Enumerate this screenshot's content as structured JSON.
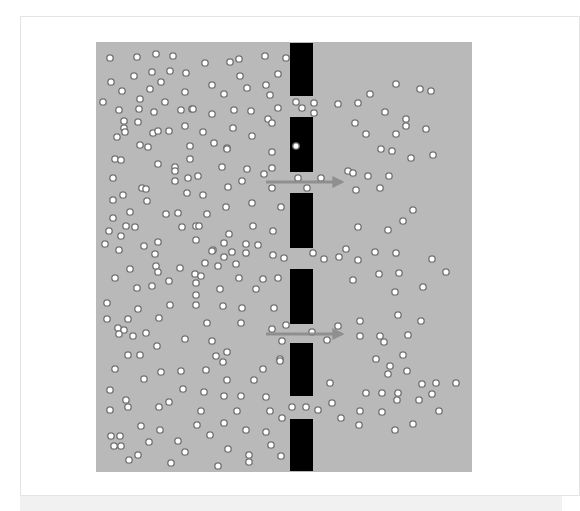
{
  "figure": {
    "colors": {
      "background": "#b9b9b9",
      "membrane": "#000000",
      "particle_fill": "#ffffff",
      "particle_stroke": "#707070",
      "arrow": "#888888"
    },
    "membrane": {
      "x": 290,
      "width": 23,
      "segments": [
        {
          "y1": 43,
          "y2": 96
        },
        {
          "y1": 117,
          "y2": 172
        },
        {
          "y1": 193,
          "y2": 248
        },
        {
          "y1": 269,
          "y2": 324
        },
        {
          "y1": 343,
          "y2": 396
        },
        {
          "y1": 419,
          "y2": 471
        }
      ]
    },
    "arrows": [
      {
        "x1": 266,
        "x2": 346,
        "y": 182,
        "direction": "right"
      },
      {
        "x1": 266,
        "x2": 346,
        "y": 334,
        "direction": "right"
      }
    ],
    "particles_left": [
      [
        110,
        58
      ],
      [
        137,
        57
      ],
      [
        156,
        54
      ],
      [
        173,
        56
      ],
      [
        134,
        76
      ],
      [
        152,
        72
      ],
      [
        170,
        71
      ],
      [
        186,
        73
      ],
      [
        111,
        82
      ],
      [
        122,
        91
      ],
      [
        150,
        89
      ],
      [
        161,
        82
      ],
      [
        185,
        92
      ],
      [
        103,
        102
      ],
      [
        119,
        110
      ],
      [
        140,
        99
      ],
      [
        139,
        109
      ],
      [
        154,
        112
      ],
      [
        165,
        102
      ],
      [
        181,
        110
      ],
      [
        192,
        109
      ],
      [
        138,
        122
      ],
      [
        124,
        128
      ],
      [
        153,
        133
      ],
      [
        117,
        137
      ],
      [
        125,
        132
      ],
      [
        124,
        121
      ],
      [
        158,
        131
      ],
      [
        169,
        131
      ],
      [
        185,
        126
      ],
      [
        140,
        145
      ],
      [
        190,
        146
      ],
      [
        205,
        63
      ],
      [
        230,
        62
      ],
      [
        239,
        59
      ],
      [
        265,
        56
      ],
      [
        286,
        58
      ],
      [
        240,
        76
      ],
      [
        278,
        74
      ],
      [
        212,
        85
      ],
      [
        224,
        94
      ],
      [
        247,
        88
      ],
      [
        266,
        85
      ],
      [
        270,
        95
      ],
      [
        193,
        109
      ],
      [
        212,
        114
      ],
      [
        234,
        110
      ],
      [
        251,
        111
      ],
      [
        278,
        108
      ],
      [
        296,
        102
      ],
      [
        268,
        119
      ],
      [
        272,
        123
      ],
      [
        203,
        132
      ],
      [
        233,
        128
      ],
      [
        252,
        136
      ],
      [
        214,
        143
      ],
      [
        227,
        148
      ],
      [
        115,
        159
      ],
      [
        121,
        160
      ],
      [
        148,
        147
      ],
      [
        175,
        167
      ],
      [
        158,
        164
      ],
      [
        175,
        171
      ],
      [
        190,
        159
      ],
      [
        113,
        178
      ],
      [
        142,
        188
      ],
      [
        146,
        189
      ],
      [
        123,
        195
      ],
      [
        113,
        200
      ],
      [
        147,
        201
      ],
      [
        175,
        181
      ],
      [
        188,
        178
      ],
      [
        187,
        193
      ],
      [
        130,
        212
      ],
      [
        166,
        214
      ],
      [
        178,
        213
      ],
      [
        113,
        218
      ],
      [
        126,
        226
      ],
      [
        135,
        227
      ],
      [
        109,
        231
      ],
      [
        121,
        236
      ],
      [
        182,
        227
      ],
      [
        196,
        226
      ],
      [
        105,
        244
      ],
      [
        119,
        250
      ],
      [
        144,
        246
      ],
      [
        158,
        242
      ],
      [
        196,
        240
      ],
      [
        227,
        149
      ],
      [
        272,
        152
      ],
      [
        222,
        167
      ],
      [
        247,
        169
      ],
      [
        272,
        168
      ],
      [
        198,
        176
      ],
      [
        242,
        181
      ],
      [
        264,
        174
      ],
      [
        228,
        187
      ],
      [
        272,
        188
      ],
      [
        203,
        195
      ],
      [
        226,
        207
      ],
      [
        252,
        203
      ],
      [
        281,
        207
      ],
      [
        207,
        214
      ],
      [
        199,
        226
      ],
      [
        253,
        226
      ],
      [
        273,
        231
      ],
      [
        229,
        234
      ],
      [
        224,
        243
      ],
      [
        213,
        250
      ],
      [
        246,
        244
      ],
      [
        258,
        245
      ],
      [
        232,
        252
      ],
      [
        155,
        254
      ],
      [
        156,
        266
      ],
      [
        180,
        268
      ],
      [
        130,
        269
      ],
      [
        115,
        278
      ],
      [
        158,
        272
      ],
      [
        137,
        288
      ],
      [
        152,
        286
      ],
      [
        169,
        281
      ],
      [
        195,
        274
      ],
      [
        196,
        283
      ],
      [
        107,
        303
      ],
      [
        170,
        305
      ],
      [
        138,
        309
      ],
      [
        107,
        319
      ],
      [
        128,
        319
      ],
      [
        159,
        318
      ],
      [
        118,
        328
      ],
      [
        124,
        330
      ],
      [
        119,
        334
      ],
      [
        146,
        333
      ],
      [
        133,
        336
      ],
      [
        185,
        339
      ],
      [
        157,
        346
      ],
      [
        128,
        355
      ],
      [
        140,
        355
      ],
      [
        212,
        251
      ],
      [
        224,
        257
      ],
      [
        246,
        253
      ],
      [
        273,
        255
      ],
      [
        284,
        258
      ],
      [
        205,
        263
      ],
      [
        218,
        266
      ],
      [
        236,
        264
      ],
      [
        201,
        276
      ],
      [
        239,
        278
      ],
      [
        263,
        279
      ],
      [
        278,
        278
      ],
      [
        220,
        289
      ],
      [
        256,
        289
      ],
      [
        196,
        295
      ],
      [
        196,
        305
      ],
      [
        223,
        306
      ],
      [
        242,
        308
      ],
      [
        274,
        308
      ],
      [
        207,
        323
      ],
      [
        241,
        323
      ],
      [
        272,
        329
      ],
      [
        286,
        325
      ],
      [
        212,
        341
      ],
      [
        282,
        341
      ],
      [
        227,
        352
      ],
      [
        216,
        356
      ],
      [
        280,
        359
      ],
      [
        115,
        369
      ],
      [
        144,
        379
      ],
      [
        161,
        372
      ],
      [
        181,
        371
      ],
      [
        110,
        390
      ],
      [
        183,
        389
      ],
      [
        126,
        400
      ],
      [
        128,
        407
      ],
      [
        110,
        410
      ],
      [
        159,
        407
      ],
      [
        169,
        402
      ],
      [
        141,
        426
      ],
      [
        160,
        430
      ],
      [
        111,
        436
      ],
      [
        120,
        436
      ],
      [
        114,
        446
      ],
      [
        121,
        446
      ],
      [
        149,
        442
      ],
      [
        178,
        441
      ],
      [
        185,
        452
      ],
      [
        138,
        455
      ],
      [
        129,
        460
      ],
      [
        171,
        463
      ],
      [
        223,
        362
      ],
      [
        206,
        370
      ],
      [
        280,
        361
      ],
      [
        263,
        369
      ],
      [
        227,
        380
      ],
      [
        254,
        380
      ],
      [
        204,
        392
      ],
      [
        224,
        396
      ],
      [
        241,
        396
      ],
      [
        266,
        397
      ],
      [
        201,
        411
      ],
      [
        237,
        411
      ],
      [
        270,
        411
      ],
      [
        282,
        418
      ],
      [
        197,
        425
      ],
      [
        224,
        423
      ],
      [
        246,
        430
      ],
      [
        266,
        432
      ],
      [
        210,
        435
      ],
      [
        271,
        445
      ],
      [
        228,
        449
      ],
      [
        249,
        455
      ],
      [
        281,
        456
      ],
      [
        249,
        462
      ],
      [
        218,
        466
      ]
    ],
    "particles_in_pores": [
      [
        296,
        146
      ],
      [
        298,
        178
      ],
      [
        302,
        108
      ],
      [
        314,
        103
      ],
      [
        314,
        113
      ],
      [
        292,
        407
      ],
      [
        306,
        407
      ],
      [
        312,
        332
      ]
    ],
    "particles_right": [
      [
        396,
        84
      ],
      [
        420,
        89
      ],
      [
        431,
        91
      ],
      [
        370,
        94
      ],
      [
        338,
        104
      ],
      [
        358,
        103
      ],
      [
        385,
        112
      ],
      [
        406,
        119
      ],
      [
        406,
        126
      ],
      [
        426,
        129
      ],
      [
        355,
        123
      ],
      [
        366,
        134
      ],
      [
        396,
        134
      ],
      [
        381,
        149
      ],
      [
        392,
        151
      ],
      [
        411,
        158
      ],
      [
        433,
        155
      ],
      [
        348,
        171
      ],
      [
        353,
        173
      ],
      [
        368,
        176
      ],
      [
        389,
        176
      ],
      [
        321,
        178
      ],
      [
        307,
        188
      ],
      [
        356,
        190
      ],
      [
        380,
        188
      ],
      [
        413,
        210
      ],
      [
        403,
        221
      ],
      [
        358,
        227
      ],
      [
        388,
        230
      ],
      [
        313,
        253
      ],
      [
        346,
        249
      ],
      [
        339,
        257
      ],
      [
        324,
        259
      ],
      [
        358,
        260
      ],
      [
        375,
        252
      ],
      [
        396,
        253
      ],
      [
        432,
        259
      ],
      [
        446,
        272
      ],
      [
        353,
        280
      ],
      [
        379,
        274
      ],
      [
        399,
        273
      ],
      [
        423,
        287
      ],
      [
        395,
        292
      ],
      [
        398,
        315
      ],
      [
        360,
        321
      ],
      [
        421,
        321
      ],
      [
        338,
        326
      ],
      [
        327,
        340
      ],
      [
        360,
        336
      ],
      [
        380,
        336
      ],
      [
        384,
        342
      ],
      [
        408,
        335
      ],
      [
        376,
        359
      ],
      [
        403,
        355
      ],
      [
        390,
        366
      ],
      [
        388,
        374
      ],
      [
        407,
        371
      ],
      [
        330,
        383
      ],
      [
        382,
        393
      ],
      [
        398,
        393
      ],
      [
        422,
        384
      ],
      [
        436,
        383
      ],
      [
        456,
        383
      ],
      [
        366,
        393
      ],
      [
        432,
        394
      ],
      [
        397,
        400
      ],
      [
        419,
        400
      ],
      [
        318,
        410
      ],
      [
        332,
        403
      ],
      [
        360,
        411
      ],
      [
        382,
        412
      ],
      [
        439,
        411
      ],
      [
        341,
        418
      ],
      [
        359,
        425
      ],
      [
        395,
        430
      ],
      [
        413,
        424
      ]
    ]
  }
}
